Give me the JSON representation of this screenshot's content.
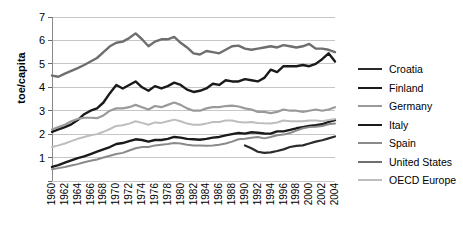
{
  "chart_data": {
    "type": "line",
    "title": "",
    "xlabel": "",
    "ylabel": "toe/capita",
    "ylim": [
      0,
      7
    ],
    "yticks": [
      0,
      1,
      2,
      3,
      4,
      5,
      6,
      7
    ],
    "ytick_labels": [
      "",
      "1",
      "2",
      "3",
      "4",
      "5",
      "6",
      "7"
    ],
    "grid": true,
    "legend_position": "right",
    "x": [
      1960,
      1961,
      1962,
      1963,
      1964,
      1965,
      1966,
      1967,
      1968,
      1969,
      1970,
      1971,
      1972,
      1973,
      1974,
      1975,
      1976,
      1977,
      1978,
      1979,
      1980,
      1981,
      1982,
      1983,
      1984,
      1985,
      1986,
      1987,
      1988,
      1989,
      1990,
      1991,
      1992,
      1993,
      1994,
      1995,
      1996,
      1997,
      1998,
      1999,
      2000,
      2001,
      2002,
      2003,
      2004
    ],
    "xtick_labels": [
      "1960",
      "1962",
      "1964",
      "1966",
      "1968",
      "1970",
      "1972",
      "1974",
      "1976",
      "1978",
      "1980",
      "1982",
      "1984",
      "1986",
      "1988",
      "1990",
      "1992",
      "1994",
      "1996",
      "1998",
      "2000",
      "2002",
      "2004"
    ],
    "series": [
      {
        "name": "Croatia",
        "color": "#2b2b2b",
        "width": 2.2,
        "values": [
          null,
          null,
          null,
          null,
          null,
          null,
          null,
          null,
          null,
          null,
          null,
          null,
          null,
          null,
          null,
          null,
          null,
          null,
          null,
          null,
          null,
          null,
          null,
          null,
          null,
          null,
          null,
          null,
          null,
          null,
          1.52,
          1.4,
          1.25,
          1.2,
          1.22,
          1.28,
          1.35,
          1.45,
          1.5,
          1.52,
          1.6,
          1.68,
          1.74,
          1.82,
          1.9
        ]
      },
      {
        "name": "Finland",
        "color": "#1a1a1a",
        "width": 2.4,
        "values": [
          2.1,
          2.2,
          2.3,
          2.42,
          2.6,
          2.85,
          3.0,
          3.1,
          3.35,
          3.75,
          4.1,
          3.95,
          4.1,
          4.25,
          4.0,
          3.85,
          4.05,
          3.95,
          4.05,
          4.2,
          4.1,
          3.9,
          3.8,
          3.85,
          3.95,
          4.15,
          4.1,
          4.3,
          4.25,
          4.25,
          4.35,
          4.3,
          4.25,
          4.4,
          4.75,
          4.65,
          4.9,
          4.9,
          4.9,
          4.95,
          4.9,
          5.0,
          5.2,
          5.45,
          5.1
        ]
      },
      {
        "name": "Germany",
        "color": "#9a9a9a",
        "width": 2.2,
        "values": [
          2.2,
          2.3,
          2.4,
          2.55,
          2.65,
          2.7,
          2.7,
          2.68,
          2.8,
          3.0,
          3.1,
          3.1,
          3.15,
          3.25,
          3.15,
          3.05,
          3.2,
          3.15,
          3.25,
          3.35,
          3.25,
          3.1,
          3.0,
          3.0,
          3.1,
          3.15,
          3.15,
          3.2,
          3.22,
          3.18,
          3.1,
          3.05,
          2.95,
          2.95,
          2.9,
          2.95,
          3.05,
          3.0,
          3.0,
          2.95,
          3.0,
          3.05,
          3.0,
          3.05,
          3.15
        ]
      },
      {
        "name": "Italy",
        "color": "#1a1a1a",
        "width": 2.4,
        "values": [
          0.6,
          0.68,
          0.78,
          0.88,
          0.98,
          1.05,
          1.15,
          1.25,
          1.35,
          1.45,
          1.58,
          1.62,
          1.7,
          1.78,
          1.75,
          1.68,
          1.75,
          1.75,
          1.8,
          1.88,
          1.85,
          1.8,
          1.78,
          1.76,
          1.8,
          1.85,
          1.88,
          1.95,
          2.0,
          2.05,
          2.02,
          2.08,
          2.06,
          2.03,
          2.02,
          2.12,
          2.12,
          2.18,
          2.25,
          2.3,
          2.35,
          2.38,
          2.42,
          2.52,
          2.6
        ]
      },
      {
        "name": "Spain",
        "color": "#8a8a8a",
        "width": 2.0,
        "values": [
          0.5,
          0.55,
          0.6,
          0.66,
          0.72,
          0.8,
          0.86,
          0.92,
          1.0,
          1.08,
          1.15,
          1.2,
          1.3,
          1.4,
          1.45,
          1.45,
          1.52,
          1.55,
          1.58,
          1.62,
          1.6,
          1.55,
          1.52,
          1.52,
          1.5,
          1.52,
          1.55,
          1.6,
          1.68,
          1.78,
          1.8,
          1.85,
          1.88,
          1.82,
          1.88,
          1.95,
          1.98,
          2.05,
          2.15,
          2.25,
          2.3,
          2.32,
          2.35,
          2.42,
          2.45
        ]
      },
      {
        "name": "United States",
        "color": "#6e6e6e",
        "width": 2.4,
        "values": [
          4.5,
          4.45,
          4.58,
          4.7,
          4.82,
          4.95,
          5.1,
          5.25,
          5.5,
          5.75,
          5.9,
          5.95,
          6.1,
          6.3,
          6.05,
          5.75,
          5.95,
          6.05,
          6.05,
          6.15,
          5.9,
          5.7,
          5.45,
          5.4,
          5.55,
          5.5,
          5.45,
          5.6,
          5.75,
          5.78,
          5.65,
          5.6,
          5.65,
          5.7,
          5.75,
          5.7,
          5.8,
          5.75,
          5.7,
          5.75,
          5.85,
          5.65,
          5.65,
          5.6,
          5.5
        ]
      },
      {
        "name": "OECD Europe",
        "color": "#bdbdbd",
        "width": 2.0,
        "values": [
          1.45,
          1.52,
          1.6,
          1.7,
          1.8,
          1.88,
          1.95,
          2.0,
          2.1,
          2.22,
          2.35,
          2.38,
          2.45,
          2.55,
          2.48,
          2.4,
          2.5,
          2.48,
          2.55,
          2.62,
          2.55,
          2.45,
          2.4,
          2.4,
          2.45,
          2.52,
          2.52,
          2.58,
          2.58,
          2.52,
          2.5,
          2.52,
          2.48,
          2.46,
          2.45,
          2.5,
          2.58,
          2.55,
          2.55,
          2.55,
          2.58,
          2.58,
          2.55,
          2.6,
          2.65
        ]
      }
    ]
  },
  "legend": {
    "items": [
      {
        "label": "Croatia"
      },
      {
        "label": "Finland"
      },
      {
        "label": "Germany"
      },
      {
        "label": "Italy"
      },
      {
        "label": "Spain"
      },
      {
        "label": "United States"
      },
      {
        "label": "OECD Europe"
      }
    ]
  },
  "axis": {
    "y_title": "toe/capita"
  }
}
